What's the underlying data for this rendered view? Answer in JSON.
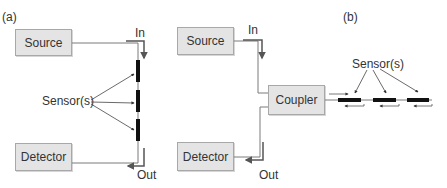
{
  "panels": {
    "a": {
      "label": "(a)",
      "source_label": "Source",
      "detector_label": "Detector",
      "sensors_label": "Sensor(s)",
      "in_label": "In",
      "out_label": "Out",
      "sensor_count": 3,
      "configuration": "transmission"
    },
    "b": {
      "label": "(b)",
      "source_label": "Source",
      "detector_label": "Detector",
      "coupler_label": "Coupler",
      "sensors_label": "Sensor(s)",
      "in_label": "In",
      "out_label": "Out",
      "sensor_count": 3,
      "configuration": "reflection"
    }
  },
  "colors": {
    "box_fill": "#e4e4e4",
    "box_border": "#a8a8a8",
    "fiber_line": "#7a7a7a",
    "sensor": "#111111",
    "arrow": "#555555",
    "text": "#333333"
  }
}
